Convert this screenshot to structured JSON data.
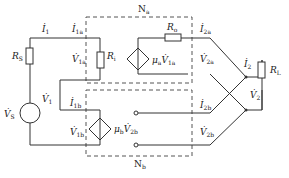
{
  "networks": {
    "top": {
      "label": "N",
      "sub": "a"
    },
    "bottom": {
      "label": "N",
      "sub": "b"
    }
  },
  "components": {
    "rs": {
      "label": "R",
      "sub": "S"
    },
    "ri": {
      "label": "R",
      "sub": "i"
    },
    "ro": {
      "label": "R",
      "sub": "o"
    },
    "rl": {
      "label": "R",
      "sub": "L"
    },
    "vs": {
      "label": "V̇",
      "sub": "S"
    },
    "dep_a": {
      "label": "μ",
      "sub": "a",
      "ctrl": "V̇",
      "ctrl_sub": "1a"
    },
    "dep_b": {
      "label": "μ",
      "sub": "b",
      "ctrl": "V̇",
      "ctrl_sub": "2b"
    }
  },
  "currents": {
    "i1": {
      "label": "İ",
      "sub": "1"
    },
    "i1a": {
      "label": "İ",
      "sub": "1a"
    },
    "i1b": {
      "label": "İ",
      "sub": "1b"
    },
    "i2a": {
      "label": "İ",
      "sub": "2a"
    },
    "i2b": {
      "label": "İ",
      "sub": "2b"
    },
    "i2": {
      "label": "İ",
      "sub": "2"
    }
  },
  "voltages": {
    "v1": {
      "label": "V̇",
      "sub": "1"
    },
    "v1a": {
      "label": "V̇",
      "sub": "1a"
    },
    "v1b": {
      "label": "V̇",
      "sub": "1b"
    },
    "v2a": {
      "label": "V̇",
      "sub": "2a"
    },
    "v2b": {
      "label": "V̇",
      "sub": "2b"
    },
    "v2": {
      "label": "V̇",
      "sub": "2"
    }
  },
  "signs": {
    "plus": "+",
    "minus": "−"
  }
}
